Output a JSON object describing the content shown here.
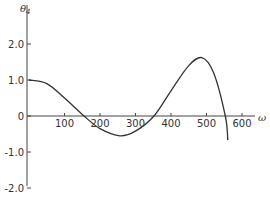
{
  "chart_data": {
    "type": "line",
    "title": "",
    "xlabel": "ω",
    "ylabel": "θ4",
    "xlim": [
      0,
      650
    ],
    "ylim": [
      -2.0,
      2.5
    ],
    "grid": false,
    "legend": null,
    "x_ticks": [
      100,
      200,
      300,
      400,
      500,
      600
    ],
    "x_tick_labels": [
      "100",
      "200",
      "300",
      "400",
      "500",
      "600"
    ],
    "y_ticks": [
      2.0,
      1.0,
      0,
      -1.0,
      -2.0
    ],
    "y_tick_labels": [
      "2.0",
      "1.0",
      "0",
      "-1.0",
      "-2.0"
    ],
    "series": [
      {
        "name": "θ4",
        "x": [
          0,
          50,
          100,
          155,
          200,
          256,
          300,
          352,
          400,
          450,
          487,
          520,
          553,
          560
        ],
        "y": [
          1.0,
          0.9,
          0.5,
          0.0,
          -0.35,
          -0.55,
          -0.42,
          0.0,
          0.7,
          1.4,
          1.62,
          1.2,
          0.0,
          -0.67
        ]
      }
    ]
  },
  "colors": {
    "axis": "#444444",
    "line": "#333333",
    "text": "#333333"
  }
}
